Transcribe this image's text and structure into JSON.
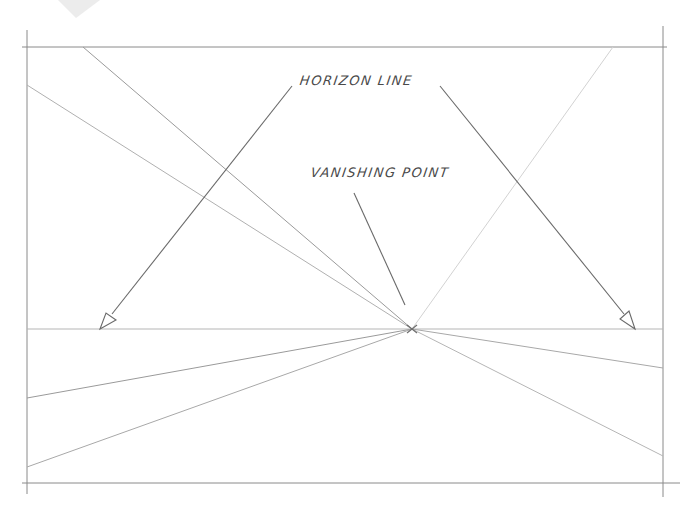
{
  "diagram": {
    "labels": {
      "horizon_line": "HORIZON LINE",
      "vanishing_point": "VANISHING POINT"
    },
    "colors": {
      "background": "#ffffff",
      "frame_stroke": "#8a8a8a",
      "construction_stroke": "#a6a6a6",
      "light_stroke": "#cfcfcf",
      "text": "#4a4a4a"
    },
    "frame": {
      "left": 27,
      "top": 47,
      "right": 663,
      "bottom": 483
    },
    "horizon_y": 329,
    "vanishing_point": {
      "x": 412,
      "y": 329
    },
    "orthogonals": [
      {
        "from": [
          83,
          47
        ],
        "to": [
          412,
          329
        ]
      },
      {
        "from": [
          27,
          85
        ],
        "to": [
          412,
          329
        ]
      },
      {
        "from": [
          613,
          47
        ],
        "to": [
          412,
          329
        ]
      },
      {
        "from": [
          27,
          398
        ],
        "to": [
          412,
          329
        ]
      },
      {
        "from": [
          27,
          467
        ],
        "to": [
          412,
          329
        ]
      },
      {
        "from": [
          663,
          368
        ],
        "to": [
          412,
          329
        ]
      },
      {
        "from": [
          663,
          456
        ],
        "to": [
          412,
          329
        ]
      }
    ],
    "arrows": [
      {
        "name": "horizon-arrow-left",
        "from": [
          292,
          86
        ],
        "to": [
          100,
          329
        ]
      },
      {
        "name": "horizon-arrow-right",
        "from": [
          440,
          86
        ],
        "to": [
          635,
          329
        ]
      }
    ],
    "pointer": {
      "name": "vanishing-point-pointer",
      "from": [
        354,
        193
      ],
      "to": [
        405,
        305
      ]
    }
  }
}
